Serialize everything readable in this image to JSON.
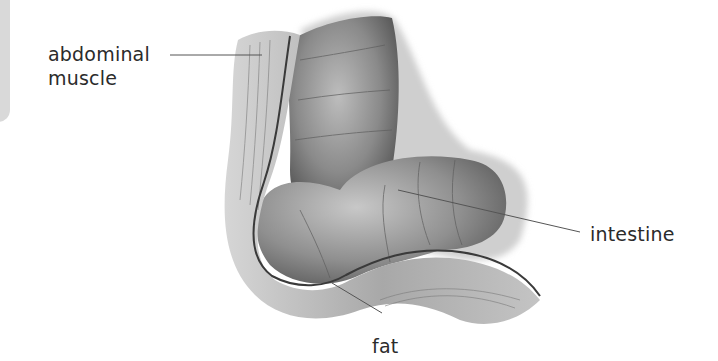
{
  "diagram": {
    "style": "grayscale anatomical illustration",
    "labels": [
      {
        "id": "abdominal-muscle",
        "lines": [
          "abdominal",
          "muscle"
        ]
      },
      {
        "id": "intestine",
        "lines": [
          "intestine"
        ]
      },
      {
        "id": "fat",
        "lines": [
          "fat"
        ]
      }
    ]
  },
  "colors": {
    "background": "#ffffff",
    "side_panel": "#d9d9d9",
    "label_text": "#2b2b2b",
    "leader_line": "#555555"
  }
}
